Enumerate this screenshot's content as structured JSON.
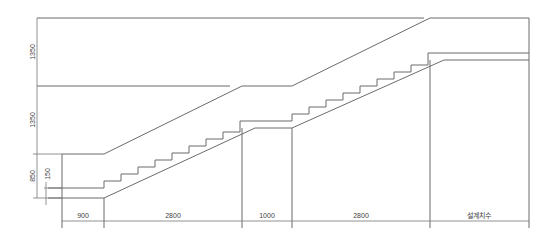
{
  "drawing": {
    "title": "Staircase section",
    "horizontal_dimensions": [
      {
        "label": "900",
        "x1": 62,
        "x2": 104
      },
      {
        "label": "2800",
        "x1": 104,
        "x2": 242
      },
      {
        "label": "1000",
        "x1": 242,
        "x2": 292
      },
      {
        "label": "2800",
        "x1": 292,
        "x2": 430
      },
      {
        "label": "설계치수",
        "x1": 430,
        "x2": 529
      }
    ],
    "vertical_dimensions": [
      {
        "label": "1350",
        "y1": 18,
        "y2": 86
      },
      {
        "label": "1350",
        "y1": 86,
        "y2": 154
      },
      {
        "label": "850",
        "y1": 154,
        "y2": 198
      },
      {
        "label": "150",
        "y1": 188,
        "y2": 198
      }
    ],
    "colors": {
      "line": "#6b6b6b",
      "text": "#444444",
      "background": "#ffffff"
    }
  }
}
